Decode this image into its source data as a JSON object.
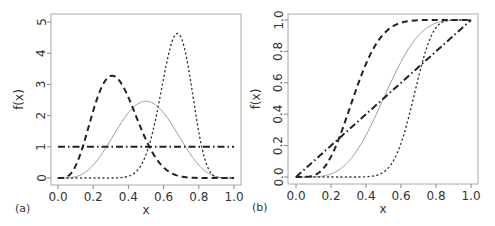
{
  "chart_data": [
    {
      "panel_label": "(a)",
      "type": "line",
      "title": "",
      "xlabel": "x",
      "ylabel": "f(x)",
      "xlim": [
        0,
        1
      ],
      "ylim": [
        0,
        5
      ],
      "xticks": [
        "0.0",
        "0.2",
        "0.4",
        "0.6",
        "0.8",
        "1.0"
      ],
      "yticks": [
        "0",
        "1",
        "2",
        "3",
        "4",
        "5"
      ],
      "grid": false,
      "legend": null,
      "function": "pdf",
      "x": [
        0,
        0.05,
        0.1,
        0.15,
        0.2,
        0.25,
        0.3,
        0.35,
        0.4,
        0.45,
        0.5,
        0.55,
        0.6,
        0.65,
        0.7,
        0.75,
        0.8,
        0.85,
        0.9,
        0.95,
        1.0
      ],
      "series": [
        {
          "name": "Beta(5,5)",
          "style": "solid",
          "color": "#999999",
          "a": 5,
          "b": 5,
          "values": [
            0,
            0.003,
            0.041,
            0.167,
            0.413,
            0.779,
            1.225,
            1.688,
            2.09,
            2.364,
            2.461,
            2.364,
            2.09,
            1.688,
            1.225,
            0.779,
            0.413,
            0.167,
            0.041,
            0.003,
            0
          ]
        },
        {
          "name": "Beta(5,10)",
          "style": "dashed",
          "color": "#222222",
          "a": 5,
          "b": 10,
          "values": [
            0,
            0.039,
            0.388,
            1.174,
            2.15,
            2.936,
            3.272,
            3.111,
            2.583,
            1.89,
            1.222,
            0.694,
            0.34,
            0.141,
            0.047,
            0.012,
            0.002,
            0,
            0,
            0,
            0
          ]
        },
        {
          "name": "Beta(20,10)",
          "style": "dotted",
          "color": "#333333",
          "a": 20,
          "b": 10,
          "values": [
            0,
            0,
            0,
            0,
            0,
            0,
            0,
            0.009,
            0.056,
            0.238,
            0.746,
            1.767,
            3.196,
            4.4,
            4.49,
            3.23,
            1.477,
            0.351,
            0.027,
            0,
            0
          ]
        },
        {
          "name": "Beta(1,1)",
          "style": "dashdot",
          "color": "#222222",
          "a": 1,
          "b": 1,
          "values": [
            1,
            1,
            1,
            1,
            1,
            1,
            1,
            1,
            1,
            1,
            1,
            1,
            1,
            1,
            1,
            1,
            1,
            1,
            1,
            1,
            1
          ]
        }
      ]
    },
    {
      "panel_label": "(b)",
      "type": "line",
      "title": "",
      "xlabel": "x",
      "ylabel": "f(x)",
      "xlim": [
        0,
        1
      ],
      "ylim": [
        0,
        1
      ],
      "xticks": [
        "0.0",
        "0.2",
        "0.4",
        "0.6",
        "0.8",
        "1.0"
      ],
      "yticks": [
        "0.0",
        "0.2",
        "0.4",
        "0.6",
        "0.8",
        "1.0"
      ],
      "grid": false,
      "legend": null,
      "function": "cdf",
      "x": [
        0,
        0.1,
        0.2,
        0.3,
        0.4,
        0.5,
        0.6,
        0.7,
        0.8,
        0.9,
        1.0
      ],
      "series": [
        {
          "name": "Beta(5,5) CDF",
          "style": "solid",
          "color": "#999999",
          "a": 5,
          "b": 5,
          "values": [
            0,
            0.001,
            0.02,
            0.099,
            0.267,
            0.5,
            0.733,
            0.901,
            0.98,
            0.999,
            1
          ]
        },
        {
          "name": "Beta(5,10) CDF",
          "style": "dashed",
          "color": "#222222",
          "a": 5,
          "b": 10,
          "values": [
            0,
            0.013,
            0.164,
            0.485,
            0.783,
            0.942,
            0.991,
            0.999,
            1,
            1,
            1
          ]
        },
        {
          "name": "Beta(20,10) CDF",
          "style": "dotted",
          "color": "#333333",
          "a": 20,
          "b": 10,
          "values": [
            0,
            0,
            0,
            0,
            0.002,
            0.031,
            0.214,
            0.589,
            0.912,
            0.997,
            1
          ]
        },
        {
          "name": "Beta(1,1) CDF",
          "style": "dashdot",
          "color": "#222222",
          "a": 1,
          "b": 1,
          "values": [
            0,
            0.1,
            0.2,
            0.3,
            0.4,
            0.5,
            0.6,
            0.7,
            0.8,
            0.9,
            1.0
          ]
        }
      ]
    }
  ],
  "panels": [
    {
      "box": {
        "left": 51,
        "top": 14,
        "right": 241,
        "bottom": 185
      },
      "x0": 58,
      "x1": 234,
      "y0": 178,
      "y1": 22
    },
    {
      "box": {
        "left": 288,
        "top": 14,
        "right": 478,
        "bottom": 184
      },
      "x0": 296,
      "x1": 471,
      "y0": 177,
      "y1": 20
    }
  ]
}
